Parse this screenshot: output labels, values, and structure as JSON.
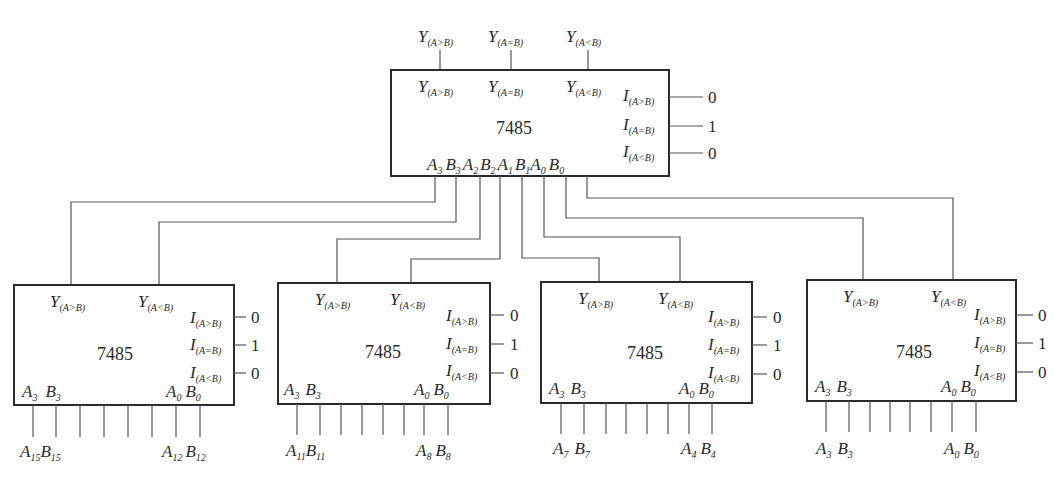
{
  "diagram": {
    "chip_label": "7485",
    "top_chip": {
      "outputs_external": [
        "Y(A>B)",
        "Y(A=B)",
        "Y(A<B)"
      ],
      "outputs_internal": [
        "Y(A>B)",
        "Y(A=B)",
        "Y(A<B)"
      ],
      "cascade_inputs": [
        {
          "name": "I(A>B)",
          "value": "0"
        },
        {
          "name": "I(A=B)",
          "value": "1"
        },
        {
          "name": "I(A<B)",
          "value": "0"
        }
      ],
      "data_inputs": [
        "A3",
        "B3",
        "A2",
        "B2",
        "A1",
        "B1",
        "A0",
        "B0"
      ]
    },
    "lower_chips": [
      {
        "id": "chip-3",
        "outputs": [
          "Y(A>B)",
          "Y(A<B)"
        ],
        "feeds": [
          "A3",
          "B3"
        ],
        "cascade_inputs": [
          "0",
          "1",
          "0"
        ],
        "pins_inside": [
          "A3",
          "B3",
          "A0",
          "B0"
        ],
        "ext_labels": [
          [
            "A",
            "15"
          ],
          [
            "B",
            "15"
          ],
          [
            "A",
            "12"
          ],
          [
            "B",
            "12"
          ]
        ]
      },
      {
        "id": "chip-2",
        "outputs": [
          "Y(A>B)",
          "Y(A<B)"
        ],
        "feeds": [
          "A2",
          "B2"
        ],
        "cascade_inputs": [
          "0",
          "1",
          "0"
        ],
        "pins_inside": [
          "A3",
          "B3",
          "A0",
          "B0"
        ],
        "ext_labels": [
          [
            "A",
            "11"
          ],
          [
            "B",
            "11"
          ],
          [
            "A",
            "8"
          ],
          [
            "B",
            "8"
          ]
        ]
      },
      {
        "id": "chip-1",
        "outputs": [
          "Y(A>B)",
          "Y(A<B)"
        ],
        "feeds": [
          "A1",
          "B1"
        ],
        "cascade_inputs": [
          "0",
          "1",
          "0"
        ],
        "pins_inside": [
          "A3",
          "B3",
          "A0",
          "B0"
        ],
        "ext_labels": [
          [
            "A",
            "7"
          ],
          [
            "B",
            "7"
          ],
          [
            "A",
            "4"
          ],
          [
            "B",
            "4"
          ]
        ]
      },
      {
        "id": "chip-0",
        "outputs": [
          "Y(A>B)",
          "Y(A<B)"
        ],
        "feeds": [
          "A0",
          "B0"
        ],
        "cascade_inputs": [
          "0",
          "1",
          "0"
        ],
        "pins_inside": [
          "A3",
          "B3",
          "A0",
          "B0"
        ],
        "ext_labels": [
          [
            "A",
            "3"
          ],
          [
            "B",
            "3"
          ],
          [
            "A",
            "0"
          ],
          [
            "B",
            "0"
          ]
        ]
      }
    ]
  },
  "text": {
    "Y": "Y",
    "I": "I",
    "A": "A",
    "B": "B",
    "gt": "(A>B)",
    "eq": "(A=B)",
    "lt": "(A<B)",
    "chip": "7485",
    "zero": "0",
    "one": "1",
    "s0": "0",
    "s1": "1",
    "s2": "2",
    "s3": "3",
    "s15": "15",
    "s12": "12",
    "s11": "11",
    "s8": "8",
    "s7": "7",
    "s4": "4"
  }
}
